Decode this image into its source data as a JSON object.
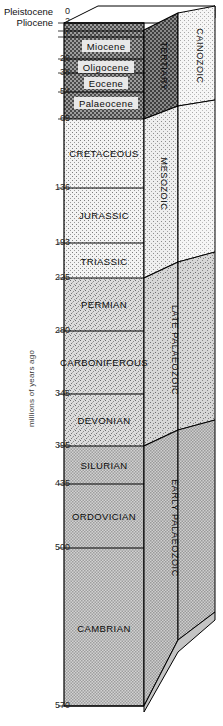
{
  "axis": {
    "caption": "millions of years ago",
    "ticks": [
      "0",
      "2",
      "7",
      "26",
      "38",
      "54",
      "65",
      "136",
      "193",
      "225",
      "280",
      "345",
      "395",
      "435",
      "500",
      "570"
    ]
  },
  "epochs_left": [
    {
      "name": "Pleistocene"
    },
    {
      "name": "Pliocene"
    }
  ],
  "tertiary_epochs": [
    {
      "name": "Miocene",
      "from": "7",
      "to": "26"
    },
    {
      "name": "Oligocene",
      "from": "26",
      "to": "38"
    },
    {
      "name": "Eocene",
      "from": "38",
      "to": "54"
    },
    {
      "name": "Palaeocene",
      "from": "54",
      "to": "65"
    }
  ],
  "periods": [
    {
      "name": "CRETACEOUS",
      "from": "65",
      "to": "136"
    },
    {
      "name": "JURASSIC",
      "from": "136",
      "to": "193"
    },
    {
      "name": "TRIASSIC",
      "from": "193",
      "to": "225"
    },
    {
      "name": "PERMIAN",
      "from": "225",
      "to": "280"
    },
    {
      "name": "CARBONIFEROUS",
      "from": "280",
      "to": "345"
    },
    {
      "name": "DEVONIAN",
      "from": "345",
      "to": "395"
    },
    {
      "name": "SILURIAN",
      "from": "395",
      "to": "435"
    },
    {
      "name": "ORDOVICIAN",
      "from": "435",
      "to": "500"
    },
    {
      "name": "CAMBRIAN",
      "from": "500",
      "to": "570"
    }
  ],
  "systems": [
    {
      "name": "TERTIARY",
      "from": "2",
      "to": "65"
    }
  ],
  "eras": [
    {
      "name": "CAINOZOIC",
      "from": "0",
      "to": "65"
    },
    {
      "name": "MESOZOIC",
      "from": "65",
      "to": "225"
    },
    {
      "name": "LATE PALAEOZOIC",
      "from": "225",
      "to": "395"
    },
    {
      "name": "EARLY PALAEOZOIC",
      "from": "395",
      "to": "570"
    }
  ],
  "colors": {
    "ink": "#000000",
    "cainozoic_fill": "#8f8f8f",
    "mesozoic_fill": "#ededed",
    "late_palaeozoic_fill": "#c9c9c9",
    "early_palaeozoic_fill": "#bdbdbd",
    "top_face": "#ffffff"
  }
}
